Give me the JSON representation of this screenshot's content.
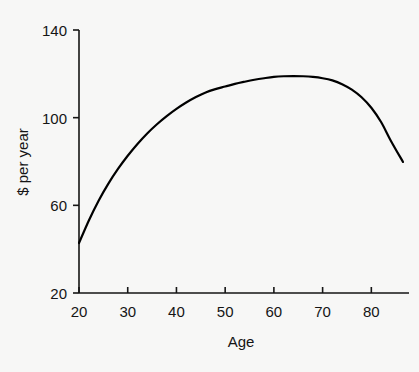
{
  "chart_data": {
    "type": "line",
    "title": "",
    "xlabel": "Age",
    "ylabel": "$ per year",
    "xlim": [
      20,
      86.5
    ],
    "ylim": [
      20,
      140
    ],
    "xticks": [
      20,
      30,
      40,
      50,
      60,
      70,
      80
    ],
    "yticks": [
      20,
      60,
      100,
      140
    ],
    "xtick_labels": [
      "20",
      "30",
      "40",
      "50",
      "60",
      "70",
      "80"
    ],
    "ytick_labels": [
      "20",
      "60",
      "100",
      "140"
    ],
    "grid": false,
    "legend": "none",
    "series": [
      {
        "name": "$ per year by age",
        "color": "#000000",
        "line_width": 2.2,
        "x": [
          20,
          22,
          24,
          26,
          28,
          30,
          32,
          34,
          36,
          38,
          40,
          42,
          44,
          46,
          48,
          50,
          52,
          54,
          56,
          58,
          60,
          62,
          64,
          66,
          68,
          70,
          72,
          74,
          76,
          78,
          80,
          82,
          84,
          86.5
        ],
        "y": [
          42.8,
          53.0,
          62.0,
          69.8,
          76.6,
          82.6,
          88.0,
          92.8,
          97.0,
          100.7,
          104.0,
          106.9,
          109.4,
          111.5,
          113.0,
          114.2,
          115.4,
          116.4,
          117.3,
          118.0,
          118.6,
          118.9,
          119.0,
          118.9,
          118.6,
          118.0,
          117.0,
          115.3,
          112.8,
          109.3,
          104.5,
          98.0,
          89.5,
          79.8
        ]
      }
    ]
  },
  "axes_geometry": {
    "plot_left_px": 79,
    "plot_right_px": 403,
    "plot_top_px": 30,
    "plot_bottom_px": 293
  }
}
